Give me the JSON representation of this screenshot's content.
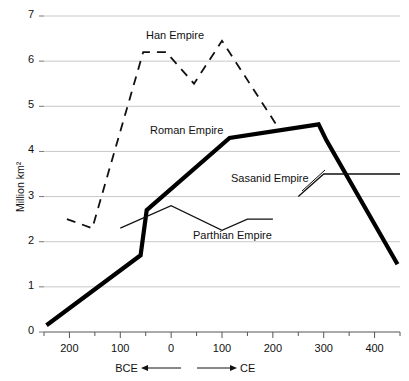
{
  "chart_data": {
    "type": "line",
    "title": "",
    "xlabel": "BCE ← → CE",
    "ylabel": "Million km²",
    "ylim": [
      0,
      7
    ],
    "yticks": [
      0,
      1,
      2,
      3,
      4,
      5,
      6,
      7
    ],
    "ytick_labels": [
      "0",
      "1",
      "2",
      "3",
      "4",
      "5",
      "6",
      "7"
    ],
    "xlim": [
      -250,
      450
    ],
    "xticks": [
      -200,
      -100,
      0,
      100,
      200,
      300,
      400
    ],
    "xtick_labels": [
      "200",
      "100",
      "0",
      "100",
      "200",
      "300",
      "400"
    ],
    "xminor_ticks": [
      -250,
      -150,
      -50,
      50,
      150,
      250,
      350,
      450
    ],
    "grid": true,
    "grid_axis": "y",
    "grid_color": "#c9c9c9",
    "legend_position": "inline-annotations",
    "series": [
      {
        "name": "Han Empire",
        "style": "dashed",
        "color": "#111111",
        "linewidth": 1.8,
        "points": [
          {
            "x": -205,
            "y": 2.5
          },
          {
            "x": -155,
            "y": 2.3
          },
          {
            "x": -55,
            "y": 6.2
          },
          {
            "x": -10,
            "y": 6.2
          },
          {
            "x": 45,
            "y": 5.5
          },
          {
            "x": 100,
            "y": 6.45
          },
          {
            "x": 215,
            "y": 4.45
          }
        ]
      },
      {
        "name": "Roman Empire",
        "style": "solid-thick",
        "color": "#000000",
        "linewidth": 4.2,
        "points": [
          {
            "x": -245,
            "y": 0.15
          },
          {
            "x": -60,
            "y": 1.7
          },
          {
            "x": -48,
            "y": 2.7
          },
          {
            "x": 115,
            "y": 4.3
          },
          {
            "x": 290,
            "y": 4.6
          },
          {
            "x": 305,
            "y": 4.25
          },
          {
            "x": 445,
            "y": 1.5
          }
        ]
      },
      {
        "name": "Parthian Empire",
        "style": "solid-thin",
        "color": "#111111",
        "linewidth": 1.3,
        "points": [
          {
            "x": -100,
            "y": 2.3
          },
          {
            "x": 0,
            "y": 2.8
          },
          {
            "x": 100,
            "y": 2.25
          },
          {
            "x": 150,
            "y": 2.5
          },
          {
            "x": 200,
            "y": 2.5
          }
        ]
      },
      {
        "name": "Sasanid Empire",
        "style": "solid-thin",
        "color": "#111111",
        "linewidth": 1.3,
        "points": [
          {
            "x": 250,
            "y": 3.0
          },
          {
            "x": 300,
            "y": 3.5
          },
          {
            "x": 450,
            "y": 3.5
          }
        ]
      }
    ],
    "annotations": [
      {
        "text": "Han Empire",
        "x_px": 146,
        "y_px": 29
      },
      {
        "text": "Roman Empire",
        "x_px": 150,
        "y_px": 124
      },
      {
        "text": "Sasanid Empire",
        "x_px": 231,
        "y_px": 172
      },
      {
        "text": "Parthian Empire",
        "x_px": 193,
        "y_px": 229
      }
    ]
  },
  "axis_note": {
    "bce_label": "BCE",
    "ce_label": "CE"
  }
}
